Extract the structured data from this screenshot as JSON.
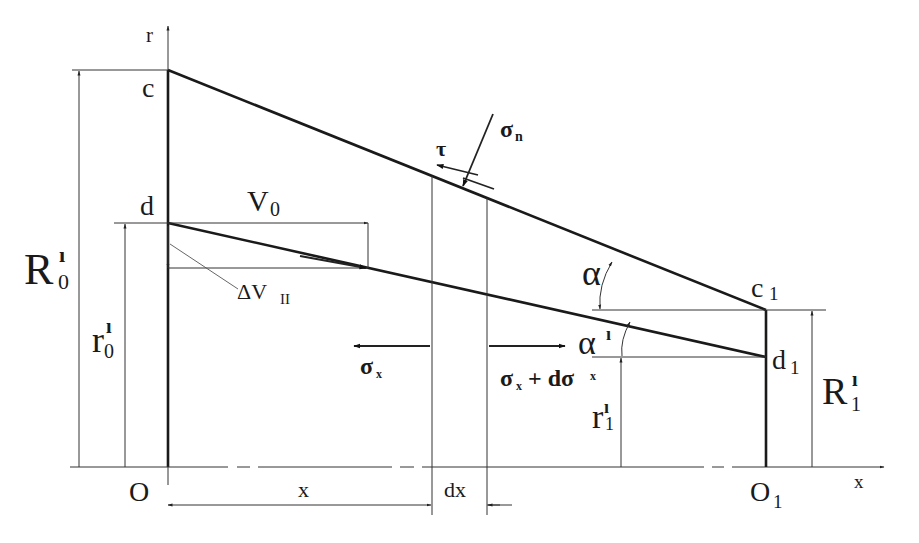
{
  "diagram": {
    "axes": {
      "vertical_label": "r",
      "horizontal_label": "x"
    },
    "points": {
      "c": "c",
      "c1": "c",
      "c1_sub": "1",
      "d": "d",
      "d1": "d",
      "d1_sub": "1",
      "O": "O",
      "O1": "O",
      "O1_sub": "1"
    },
    "dimensions": {
      "R0": "R",
      "R0_prime": "ı",
      "R0_sub": "0",
      "r0": "r",
      "r0_prime": "ı",
      "r0_sub": "0",
      "R1": "R",
      "R1_prime": "ı",
      "R1_sub": "1",
      "r1": "r",
      "r1_prime": "ı",
      "r1_sub": "1",
      "x": "x",
      "dx": "dx"
    },
    "velocities": {
      "V0": "V",
      "V0_sub": "0",
      "dV": "ΔV",
      "dV_sub": "II"
    },
    "angles": {
      "alpha": "α",
      "alpha_prime": "α",
      "alpha_prime_mark": "ı"
    },
    "stresses": {
      "tau": "τ",
      "sigma_n": "σ",
      "sigma_n_sub": "n",
      "sigma_x": "σ",
      "sigma_x_sub": "x",
      "sigma_x_plus": "σ",
      "sigma_x_plus_sub": "x",
      "sigma_x_plus_mid": " + dσ",
      "sigma_x_plus_sub2": "x"
    }
  }
}
